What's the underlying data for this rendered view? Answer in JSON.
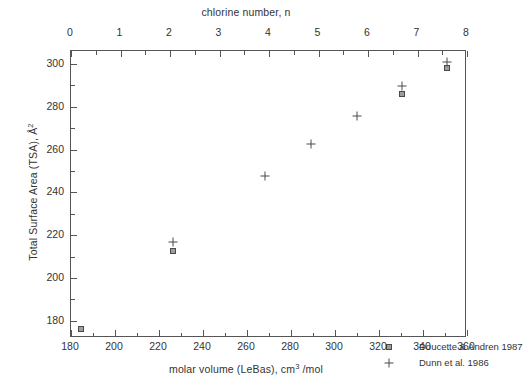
{
  "chart_data": {
    "type": "scatter",
    "title": "",
    "xlabel": "molar volume (LeBas), cm3 /mol",
    "ylabel": "Total Surface Area (TSA), A2",
    "top_axis_label": "chlorine number, n",
    "xlim": [
      180,
      360
    ],
    "ylim": [
      172,
      306
    ],
    "top_xlim": [
      0,
      8
    ],
    "xticks": [
      180,
      200,
      220,
      240,
      260,
      280,
      300,
      320,
      340,
      360
    ],
    "xtick_labels": [
      "180",
      "200",
      "220",
      "240",
      "260",
      "280",
      "300",
      "320",
      "340",
      "360"
    ],
    "x_minor_ticks": [
      190,
      210,
      230,
      250,
      270,
      290,
      310,
      330,
      350
    ],
    "yticks": [
      180,
      200,
      220,
      240,
      260,
      280,
      300
    ],
    "ytick_labels": [
      "180",
      "200",
      "220",
      "240",
      "260",
      "280",
      "300"
    ],
    "y_minor_ticks": [
      190,
      210,
      230,
      250,
      270,
      290
    ],
    "top_xticks": [
      0,
      1,
      2,
      3,
      4,
      5,
      6,
      7,
      8
    ],
    "top_xtick_labels": [
      "0",
      "1",
      "2",
      "3",
      "4",
      "5",
      "6",
      "7",
      "8"
    ],
    "grid": false,
    "legend_position": "lower right",
    "series": [
      {
        "name": "Doucette & Andren 1987",
        "marker": "square",
        "color": "#9d9d9d",
        "edge_color": "#4a4a4a",
        "points": [
          {
            "x": 184.5,
            "y": 176.0
          },
          {
            "x": 226.3,
            "y": 212.5
          },
          {
            "x": 330.5,
            "y": 286.0
          },
          {
            "x": 351.0,
            "y": 298.0
          }
        ]
      },
      {
        "name": "Dunn et al. 1986",
        "marker": "plus",
        "color": "#4a4a4a",
        "edge_color": "#4a4a4a",
        "points": [
          {
            "x": 226.3,
            "y": 216.8
          },
          {
            "x": 268.0,
            "y": 247.8
          },
          {
            "x": 289.0,
            "y": 262.5
          },
          {
            "x": 310.0,
            "y": 275.5
          },
          {
            "x": 330.5,
            "y": 289.5
          },
          {
            "x": 351.0,
            "y": 301.0
          }
        ]
      }
    ]
  },
  "axes": {
    "top_title": "chlorine number, n",
    "bottom_title_pre": "molar volume (LeBas), cm",
    "bottom_title_sup": "3",
    "bottom_title_post": " /mol",
    "y_title_pre": "Total Surface Area (TSA), Å",
    "y_title_sup": "2"
  },
  "legend": {
    "entries": [
      {
        "label": "Doucette & Andren 1987",
        "marker": "square"
      },
      {
        "label": "Dunn et al. 1986",
        "marker": "plus"
      }
    ]
  }
}
